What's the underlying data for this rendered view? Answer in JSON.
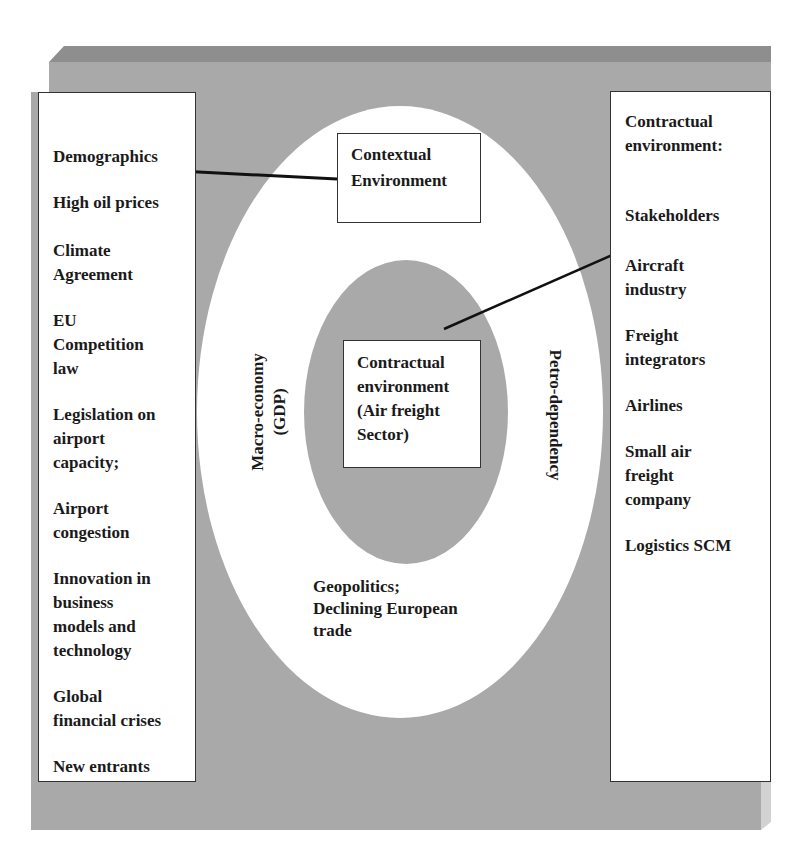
{
  "colors": {
    "slab_face": "#a9a9a9",
    "slab_top": "#8e8e8e",
    "slab_side": "#d2d2d2",
    "outer_ellipse": "#ffffff",
    "inner_ellipse": "#a9a9a9",
    "box_border": "#333333",
    "text": "#1a1a1a"
  },
  "left_panel": {
    "items": [
      {
        "label": "Demographics"
      },
      {
        "label": "High oil prices"
      },
      {
        "label": "Climate\nAgreement"
      },
      {
        "label": "EU\nCompetition\nlaw"
      },
      {
        "label": "Legislation on\nairport\ncapacity;"
      },
      {
        "label": "Airport\ncongestion"
      },
      {
        "label": "Innovation in\nbusiness\nmodels and\ntechnology"
      },
      {
        "label": "Global\nfinancial crises"
      },
      {
        "label": "New entrants"
      }
    ]
  },
  "right_panel": {
    "heading": "Contractual\nenvironment:",
    "items": [
      {
        "label": "Stakeholders"
      },
      {
        "label": "Aircraft\nindustry"
      },
      {
        "label": "Freight\nintegrators"
      },
      {
        "label": "Airlines"
      },
      {
        "label": "Small air\nfreight\ncompany"
      },
      {
        "label": "Logistics SCM"
      }
    ]
  },
  "center": {
    "contextual_box": "Contextual\nEnvironment",
    "core_box": "Contractual\nenvironment\n(Air freight\nSector)",
    "left_vertical": "Macro-economy\n(GDP)",
    "right_vertical": "Petro-dependency",
    "bottom_label": "Geopolitics;\nDeclining European\ntrade"
  },
  "arrows": [
    {
      "from": "contextual-box",
      "to": "left-panel",
      "x1": 337,
      "y1": 179,
      "x2": 160,
      "y2": 170
    },
    {
      "from": "inner-ellipse",
      "to": "right-panel",
      "x1": 444,
      "y1": 329,
      "x2": 660,
      "y2": 234
    }
  ]
}
